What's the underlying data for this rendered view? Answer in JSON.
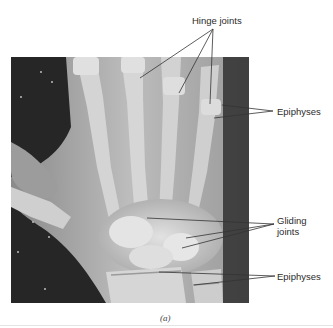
{
  "figure": {
    "caption": "(a)",
    "labels": {
      "hinge_joints": "Hinge joints",
      "epiphyses_top": "Epiphyses",
      "gliding_joints_line1": "Gliding",
      "gliding_joints_line2": "joints",
      "epiphyses_bottom": "Epiphyses"
    }
  },
  "colors": {
    "background": "#ffffff",
    "xray_dark": "#2a2a2a",
    "bone": "#d9d9d9",
    "leader_line": "#333333",
    "label_text": "#2b2b2b"
  }
}
